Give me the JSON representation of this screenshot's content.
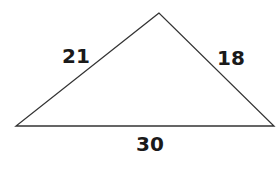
{
  "triangle": {
    "sides": {
      "left": "21",
      "right": "18",
      "base": "30"
    },
    "stroke_color": "#333333"
  }
}
